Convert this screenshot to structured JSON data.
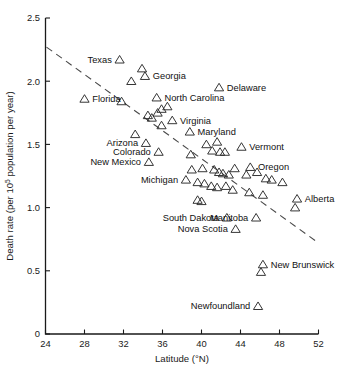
{
  "chart_data": {
    "type": "scatter",
    "title": "",
    "xlabel": "Latitude (°N)",
    "ylabel": "Death rate (per 10⁵ population per year)",
    "ylabel_prefix": "Death rate (per 10",
    "ylabel_sup": "5",
    "ylabel_suffix": " population per year)",
    "xlim": [
      24,
      52
    ],
    "ylim": [
      0,
      2.5
    ],
    "xticks": [
      24,
      28,
      32,
      36,
      40,
      44,
      48,
      52
    ],
    "xtick_labels": [
      "24",
      "28",
      "32",
      "36",
      "40",
      "44",
      "48",
      "52"
    ],
    "yticks": [
      0,
      0.5,
      1.0,
      1.5,
      2.0,
      2.5
    ],
    "ytick_labels": [
      "0",
      "0.5",
      "1.0",
      "1.5",
      "2.0",
      "2.5"
    ],
    "grid": false,
    "legend": "none",
    "marker": "triangle-outline",
    "trendline": {
      "type": "dashed-linear",
      "x_start": 24.1,
      "y_start": 2.27,
      "x_end": 52.0,
      "y_end": 0.72
    },
    "points": [
      {
        "x": 31.6,
        "y": 2.17,
        "label": "Texas",
        "label_side": "left"
      },
      {
        "x": 33.9,
        "y": 2.1,
        "label": "",
        "label_side": "none"
      },
      {
        "x": 34.2,
        "y": 2.04,
        "label": "Georgia",
        "label_side": "right"
      },
      {
        "x": 32.8,
        "y": 2.0,
        "label": "",
        "label_side": "none"
      },
      {
        "x": 41.8,
        "y": 1.95,
        "label": "Delaware",
        "label_side": "right"
      },
      {
        "x": 28.0,
        "y": 1.86,
        "label": "Florida",
        "label_side": "right"
      },
      {
        "x": 31.8,
        "y": 1.84,
        "label": "",
        "label_side": "none"
      },
      {
        "x": 35.4,
        "y": 1.87,
        "label": "North Carolina",
        "label_side": "right"
      },
      {
        "x": 35.9,
        "y": 1.78,
        "label": "",
        "label_side": "none"
      },
      {
        "x": 36.5,
        "y": 1.8,
        "label": "",
        "label_side": "none"
      },
      {
        "x": 35.5,
        "y": 1.75,
        "label": "",
        "label_side": "none"
      },
      {
        "x": 34.5,
        "y": 1.73,
        "label": "",
        "label_side": "none"
      },
      {
        "x": 34.9,
        "y": 1.71,
        "label": "",
        "label_side": "none"
      },
      {
        "x": 37.0,
        "y": 1.69,
        "label": "Virginia",
        "label_side": "right"
      },
      {
        "x": 35.9,
        "y": 1.65,
        "label": "",
        "label_side": "none"
      },
      {
        "x": 33.2,
        "y": 1.58,
        "label": "",
        "label_side": "none"
      },
      {
        "x": 38.8,
        "y": 1.6,
        "label": "Maryland",
        "label_side": "right"
      },
      {
        "x": 34.3,
        "y": 1.51,
        "label": "Arizona",
        "label_side": "left"
      },
      {
        "x": 35.6,
        "y": 1.44,
        "label": "Colorado",
        "label_side": "left"
      },
      {
        "x": 40.5,
        "y": 1.5,
        "label": "",
        "label_side": "none"
      },
      {
        "x": 41.6,
        "y": 1.52,
        "label": "",
        "label_side": "none"
      },
      {
        "x": 41.1,
        "y": 1.45,
        "label": "",
        "label_side": "none"
      },
      {
        "x": 41.9,
        "y": 1.44,
        "label": "",
        "label_side": "none"
      },
      {
        "x": 42.4,
        "y": 1.44,
        "label": "",
        "label_side": "none"
      },
      {
        "x": 44.1,
        "y": 1.48,
        "label": "Vermont",
        "label_side": "right"
      },
      {
        "x": 38.9,
        "y": 1.42,
        "label": "",
        "label_side": "none"
      },
      {
        "x": 34.6,
        "y": 1.36,
        "label": "New Mexico",
        "label_side": "left"
      },
      {
        "x": 45.0,
        "y": 1.32,
        "label": "Oregon",
        "label_side": "right"
      },
      {
        "x": 39.0,
        "y": 1.3,
        "label": "",
        "label_side": "none"
      },
      {
        "x": 40.1,
        "y": 1.31,
        "label": "",
        "label_side": "none"
      },
      {
        "x": 41.3,
        "y": 1.3,
        "label": "",
        "label_side": "none"
      },
      {
        "x": 41.8,
        "y": 1.28,
        "label": "",
        "label_side": "none"
      },
      {
        "x": 42.2,
        "y": 1.27,
        "label": "",
        "label_side": "none"
      },
      {
        "x": 42.8,
        "y": 1.26,
        "label": "",
        "label_side": "none"
      },
      {
        "x": 43.4,
        "y": 1.31,
        "label": "",
        "label_side": "none"
      },
      {
        "x": 44.6,
        "y": 1.26,
        "label": "",
        "label_side": "none"
      },
      {
        "x": 45.7,
        "y": 1.28,
        "label": "",
        "label_side": "none"
      },
      {
        "x": 46.6,
        "y": 1.23,
        "label": "",
        "label_side": "none"
      },
      {
        "x": 47.2,
        "y": 1.22,
        "label": "",
        "label_side": "none"
      },
      {
        "x": 48.3,
        "y": 1.2,
        "label": "",
        "label_side": "none"
      },
      {
        "x": 38.4,
        "y": 1.22,
        "label": "Michigan",
        "label_side": "left"
      },
      {
        "x": 39.6,
        "y": 1.2,
        "label": "",
        "label_side": "none"
      },
      {
        "x": 40.3,
        "y": 1.19,
        "label": "",
        "label_side": "none"
      },
      {
        "x": 41.0,
        "y": 1.17,
        "label": "",
        "label_side": "none"
      },
      {
        "x": 41.6,
        "y": 1.16,
        "label": "",
        "label_side": "none"
      },
      {
        "x": 42.5,
        "y": 1.17,
        "label": "",
        "label_side": "none"
      },
      {
        "x": 43.2,
        "y": 1.14,
        "label": "",
        "label_side": "none"
      },
      {
        "x": 44.9,
        "y": 1.12,
        "label": "",
        "label_side": "none"
      },
      {
        "x": 46.3,
        "y": 1.1,
        "label": "",
        "label_side": "none"
      },
      {
        "x": 49.8,
        "y": 1.07,
        "label": "Alberta",
        "label_side": "right"
      },
      {
        "x": 49.6,
        "y": 1.0,
        "label": "",
        "label_side": "none"
      },
      {
        "x": 39.6,
        "y": 1.06,
        "label": "",
        "label_side": "none"
      },
      {
        "x": 40.0,
        "y": 1.05,
        "label": "",
        "label_side": "none"
      },
      {
        "x": 42.6,
        "y": 0.92,
        "label": "South Dakota",
        "label_side": "left"
      },
      {
        "x": 45.6,
        "y": 0.92,
        "label": "Manitoba",
        "label_side": "left"
      },
      {
        "x": 43.5,
        "y": 0.83,
        "label": "Nova Scotia",
        "label_side": "left"
      },
      {
        "x": 46.3,
        "y": 0.55,
        "label": "New Brunswick",
        "label_side": "right"
      },
      {
        "x": 46.1,
        "y": 0.49,
        "label": "",
        "label_side": "none"
      },
      {
        "x": 45.8,
        "y": 0.22,
        "label": "Newfoundland",
        "label_side": "left"
      }
    ]
  }
}
